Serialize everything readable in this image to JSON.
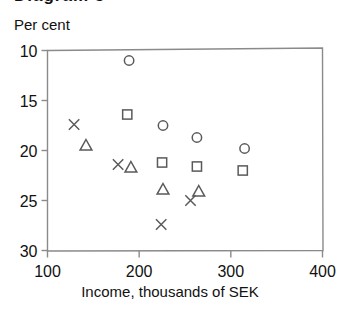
{
  "figure": {
    "title_cut": "Diagram 5",
    "y_axis_caption": "Per cent",
    "x_axis_caption": "Income, thousands of SEK"
  },
  "axes": {
    "y_ticks": [
      "30",
      "25",
      "20",
      "15",
      "10"
    ],
    "x_ticks": [
      "100",
      "200",
      "300",
      "400"
    ]
  },
  "colors": {
    "axis": "#8a8a8a",
    "marker": "#5a5a5a",
    "text": "#111111",
    "background": "#ffffff"
  },
  "chart_data": {
    "type": "scatter",
    "title": "",
    "xlabel": "Income, thousands of SEK",
    "ylabel": "Per cent",
    "xlim": [
      100,
      400
    ],
    "ylim": [
      10,
      30
    ],
    "xticks": [
      100,
      200,
      300,
      400
    ],
    "yticks": [
      10,
      15,
      20,
      25,
      30
    ],
    "grid": false,
    "legend": null,
    "series": [
      {
        "name": "circle",
        "marker": "circle",
        "points": [
          {
            "x": 189,
            "y": 29.0
          },
          {
            "x": 226,
            "y": 22.5
          },
          {
            "x": 263,
            "y": 21.3
          },
          {
            "x": 315,
            "y": 20.2
          }
        ]
      },
      {
        "name": "square",
        "marker": "square",
        "points": [
          {
            "x": 187,
            "y": 23.6
          },
          {
            "x": 225,
            "y": 18.8
          },
          {
            "x": 263,
            "y": 18.4
          },
          {
            "x": 313,
            "y": 18.0
          }
        ]
      },
      {
        "name": "triangle",
        "marker": "triangle",
        "points": [
          {
            "x": 142,
            "y": 20.5
          },
          {
            "x": 191,
            "y": 18.3
          },
          {
            "x": 226,
            "y": 16.1
          },
          {
            "x": 265,
            "y": 15.9
          }
        ]
      },
      {
        "name": "cross",
        "marker": "x",
        "points": [
          {
            "x": 129,
            "y": 22.6
          },
          {
            "x": 177,
            "y": 18.6
          },
          {
            "x": 224,
            "y": 12.6
          },
          {
            "x": 256,
            "y": 15.0
          }
        ]
      }
    ]
  }
}
